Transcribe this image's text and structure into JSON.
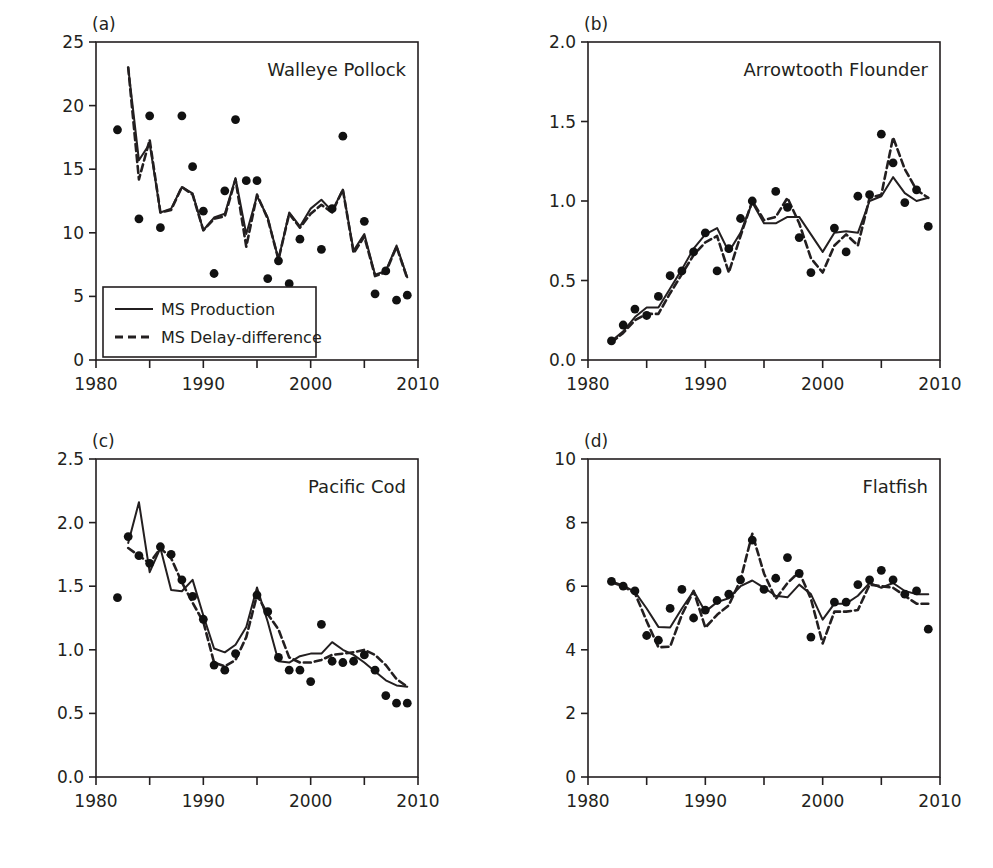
{
  "figure": {
    "xlabel": "Year",
    "ylabel": "Biomass",
    "legend": {
      "production_label": "MS Production",
      "delay_label": "MS Delay-difference",
      "position": "panel-a-lower-left"
    },
    "colors": {
      "ink": "#231f20",
      "background": "#ffffff",
      "point": "#111111"
    }
  },
  "chart_data": [
    {
      "type": "line",
      "panel": "(a)",
      "title": "Walleye Pollock",
      "xlabel": "Year",
      "ylabel": "Biomass",
      "xlim": [
        1980,
        2010
      ],
      "ylim": [
        0,
        25
      ],
      "xticks": [
        1980,
        1990,
        2000,
        2010
      ],
      "xticks_minor": [
        1985,
        1995,
        2005
      ],
      "yticks": [
        0,
        5,
        10,
        15,
        20,
        25
      ],
      "grid": false,
      "legend": [
        "MS Production",
        "MS Delay-difference"
      ],
      "x": [
        1982,
        1983,
        1984,
        1985,
        1986,
        1987,
        1988,
        1989,
        1990,
        1991,
        1992,
        1993,
        1994,
        1995,
        1996,
        1997,
        1998,
        1999,
        2000,
        2001,
        2002,
        2003,
        2004,
        2005,
        2006,
        2007,
        2008,
        2009
      ],
      "series": [
        {
          "name": "MS Production",
          "style": "solid",
          "x": [
            1983,
            1984,
            1985,
            1986,
            1987,
            1988,
            1989,
            1990,
            1991,
            1992,
            1993,
            1994,
            1995,
            1996,
            1997,
            1998,
            1999,
            2000,
            2001,
            2002,
            2003,
            2004,
            2005,
            2006,
            2007,
            2008,
            2009
          ],
          "values": [
            23.0,
            15.7,
            17.0,
            11.6,
            11.9,
            13.6,
            13.1,
            10.2,
            11.2,
            11.5,
            14.3,
            9.9,
            12.9,
            11.2,
            7.9,
            11.6,
            10.5,
            11.9,
            12.6,
            11.7,
            13.4,
            8.6,
            9.9,
            6.7,
            7.0,
            9.0,
            6.5
          ]
        },
        {
          "name": "MS Delay-difference",
          "style": "dashed",
          "x": [
            1983,
            1984,
            1985,
            1986,
            1987,
            1988,
            1989,
            1990,
            1991,
            1992,
            1993,
            1994,
            1995,
            1996,
            1997,
            1998,
            1999,
            2000,
            2001,
            2002,
            2003,
            2004,
            2005,
            2006,
            2007,
            2008,
            2009
          ],
          "values": [
            23.0,
            14.2,
            17.3,
            11.6,
            11.8,
            13.6,
            13.0,
            10.2,
            11.1,
            11.3,
            14.2,
            8.9,
            13.0,
            11.1,
            7.9,
            11.5,
            10.4,
            11.5,
            12.2,
            11.6,
            13.4,
            8.4,
            9.7,
            6.6,
            6.9,
            8.9,
            6.4
          ]
        }
      ],
      "points": {
        "name": "observed",
        "x": [
          1982,
          1984,
          1985,
          1986,
          1988,
          1989,
          1990,
          1991,
          1992,
          1993,
          1994,
          1995,
          1996,
          1997,
          1998,
          1999,
          2001,
          2002,
          2003,
          2005,
          2006,
          2007,
          2008,
          2009
        ],
        "values": [
          18.1,
          11.1,
          19.2,
          10.4,
          19.2,
          15.2,
          11.7,
          6.8,
          13.3,
          18.9,
          14.1,
          14.1,
          6.4,
          7.8,
          6.0,
          9.5,
          8.7,
          11.9,
          17.6,
          10.9,
          5.2,
          7.0,
          4.7,
          5.1
        ]
      }
    },
    {
      "type": "line",
      "panel": "(b)",
      "title": "Arrowtooth Flounder",
      "xlabel": "Year",
      "ylabel": "Biomass",
      "xlim": [
        1980,
        2010
      ],
      "ylim": [
        0.0,
        2.0
      ],
      "xticks": [
        1980,
        1990,
        2000,
        2010
      ],
      "xticks_minor": [
        1985,
        1995,
        2005
      ],
      "yticks": [
        0.0,
        0.5,
        1.0,
        1.5,
        2.0
      ],
      "grid": false,
      "legend": [
        "MS Production",
        "MS Delay-difference"
      ],
      "x": [
        1982,
        1983,
        1984,
        1985,
        1986,
        1987,
        1988,
        1989,
        1990,
        1991,
        1992,
        1993,
        1994,
        1995,
        1996,
        1997,
        1998,
        1999,
        2000,
        2001,
        2002,
        2003,
        2004,
        2005,
        2006,
        2007,
        2008,
        2009
      ],
      "series": [
        {
          "name": "MS Production",
          "style": "solid",
          "x": [
            1982,
            1983,
            1984,
            1985,
            1986,
            1987,
            1988,
            1989,
            1990,
            1991,
            1992,
            1993,
            1994,
            1995,
            1996,
            1997,
            1998,
            1999,
            2000,
            2001,
            2002,
            2003,
            2004,
            2005,
            2006,
            2007,
            2008,
            2009
          ],
          "values": [
            0.12,
            0.18,
            0.27,
            0.33,
            0.33,
            0.45,
            0.57,
            0.7,
            0.79,
            0.83,
            0.68,
            0.8,
            0.99,
            0.86,
            0.86,
            0.9,
            0.9,
            0.79,
            0.68,
            0.8,
            0.81,
            0.8,
            1.0,
            1.03,
            1.15,
            1.05,
            1.0,
            1.02
          ]
        },
        {
          "name": "MS Delay-difference",
          "style": "dashed",
          "x": [
            1982,
            1983,
            1984,
            1985,
            1986,
            1987,
            1988,
            1989,
            1990,
            1991,
            1992,
            1993,
            1994,
            1995,
            1996,
            1997,
            1998,
            1999,
            2000,
            2001,
            2002,
            2003,
            2004,
            2005,
            2006,
            2007,
            2008,
            2009
          ],
          "values": [
            0.11,
            0.17,
            0.25,
            0.29,
            0.29,
            0.42,
            0.54,
            0.66,
            0.74,
            0.78,
            0.55,
            0.78,
            1.0,
            0.88,
            0.9,
            1.02,
            0.86,
            0.64,
            0.55,
            0.72,
            0.79,
            0.72,
            1.02,
            1.04,
            1.4,
            1.2,
            1.07,
            1.02
          ]
        }
      ],
      "points": {
        "name": "observed",
        "x": [
          1982,
          1983,
          1984,
          1985,
          1986,
          1987,
          1988,
          1989,
          1990,
          1991,
          1992,
          1993,
          1994,
          1996,
          1997,
          1998,
          1999,
          2001,
          2002,
          2003,
          2004,
          2005,
          2006,
          2007,
          2008,
          2009
        ],
        "values": [
          0.12,
          0.22,
          0.32,
          0.28,
          0.4,
          0.53,
          0.56,
          0.68,
          0.8,
          0.56,
          0.7,
          0.89,
          1.0,
          1.06,
          0.96,
          0.77,
          0.55,
          0.83,
          0.68,
          1.03,
          1.04,
          1.42,
          1.24,
          0.99,
          1.07,
          0.84
        ]
      }
    },
    {
      "type": "line",
      "panel": "(c)",
      "title": "Pacific Cod",
      "xlabel": "Year",
      "ylabel": "Biomass",
      "xlim": [
        1980,
        2010
      ],
      "ylim": [
        0.0,
        2.5
      ],
      "xticks": [
        1980,
        1990,
        2000,
        2010
      ],
      "xticks_minor": [
        1985,
        1995,
        2005
      ],
      "yticks": [
        0.0,
        0.5,
        1.0,
        1.5,
        2.0,
        2.5
      ],
      "grid": false,
      "legend": [
        "MS Production",
        "MS Delay-difference"
      ],
      "x": [
        1982,
        1983,
        1984,
        1985,
        1986,
        1987,
        1988,
        1989,
        1990,
        1991,
        1992,
        1993,
        1994,
        1995,
        1996,
        1997,
        1998,
        1999,
        2000,
        2001,
        2002,
        2003,
        2004,
        2005,
        2006,
        2007,
        2008,
        2009
      ],
      "series": [
        {
          "name": "MS Production",
          "style": "solid",
          "x": [
            1983,
            1984,
            1985,
            1986,
            1987,
            1988,
            1989,
            1990,
            1991,
            1992,
            1993,
            1994,
            1995,
            1996,
            1997,
            1998,
            1999,
            2000,
            2001,
            2002,
            2003,
            2004,
            2005,
            2006,
            2007,
            2008,
            2009
          ],
          "values": [
            1.84,
            2.16,
            1.61,
            1.8,
            1.47,
            1.46,
            1.55,
            1.27,
            1.01,
            0.98,
            1.04,
            1.18,
            1.49,
            1.22,
            0.91,
            0.9,
            0.95,
            0.97,
            0.97,
            1.06,
            1.0,
            0.96,
            0.9,
            0.83,
            0.76,
            0.72,
            0.71
          ]
        },
        {
          "name": "MS Delay-difference",
          "style": "dashed",
          "x": [
            1983,
            1984,
            1985,
            1986,
            1987,
            1988,
            1989,
            1990,
            1991,
            1992,
            1993,
            1994,
            1995,
            1996,
            1997,
            1998,
            1999,
            2000,
            2001,
            2002,
            2003,
            2004,
            2005,
            2006,
            2007,
            2008,
            2009
          ],
          "values": [
            1.8,
            1.74,
            1.68,
            1.8,
            1.72,
            1.53,
            1.37,
            1.22,
            0.9,
            0.87,
            0.92,
            1.1,
            1.43,
            1.28,
            1.16,
            0.94,
            0.9,
            0.9,
            0.92,
            0.96,
            0.97,
            0.98,
            1.0,
            0.96,
            0.88,
            0.77,
            0.71
          ]
        }
      ],
      "points": {
        "name": "observed",
        "x": [
          1982,
          1983,
          1984,
          1985,
          1986,
          1987,
          1988,
          1989,
          1990,
          1991,
          1992,
          1993,
          1995,
          1996,
          1997,
          1998,
          1999,
          2000,
          2001,
          2002,
          2003,
          2004,
          2005,
          2006,
          2007,
          2008,
          2009
        ],
        "values": [
          1.41,
          1.89,
          1.74,
          1.68,
          1.81,
          1.75,
          1.55,
          1.42,
          1.24,
          0.88,
          0.84,
          0.97,
          1.43,
          1.3,
          0.94,
          0.84,
          0.84,
          0.75,
          1.2,
          0.91,
          0.9,
          0.91,
          0.96,
          0.84,
          0.64,
          0.58,
          0.58
        ]
      }
    },
    {
      "type": "line",
      "panel": "(d)",
      "title": "Flatfish",
      "xlabel": "Year",
      "ylabel": "Biomass",
      "xlim": [
        1980,
        2010
      ],
      "ylim": [
        0,
        10
      ],
      "xticks": [
        1980,
        1990,
        2000,
        2010
      ],
      "xticks_minor": [
        1985,
        1995,
        2005
      ],
      "yticks": [
        0,
        2,
        4,
        6,
        8,
        10
      ],
      "grid": false,
      "legend": [
        "MS Production",
        "MS Delay-difference"
      ],
      "x": [
        1982,
        1983,
        1984,
        1985,
        1986,
        1987,
        1988,
        1989,
        1990,
        1991,
        1992,
        1993,
        1994,
        1995,
        1996,
        1997,
        1998,
        1999,
        2000,
        2001,
        2002,
        2003,
        2004,
        2005,
        2006,
        2007,
        2008,
        2009
      ],
      "series": [
        {
          "name": "MS Production",
          "style": "solid",
          "x": [
            1982,
            1983,
            1984,
            1985,
            1986,
            1987,
            1988,
            1989,
            1990,
            1991,
            1992,
            1993,
            1994,
            1995,
            1996,
            1997,
            1998,
            1999,
            2000,
            2001,
            2002,
            2003,
            2004,
            2005,
            2006,
            2007,
            2008,
            2009
          ],
          "values": [
            6.15,
            6.02,
            5.82,
            5.3,
            4.72,
            4.7,
            5.3,
            5.85,
            5.2,
            5.5,
            5.62,
            6.0,
            6.18,
            5.95,
            5.7,
            5.65,
            6.05,
            5.75,
            4.95,
            5.45,
            5.45,
            5.7,
            6.1,
            5.95,
            6.1,
            5.85,
            5.75,
            5.75
          ]
        },
        {
          "name": "MS Delay-difference",
          "style": "dashed",
          "x": [
            1982,
            1983,
            1984,
            1985,
            1986,
            1987,
            1988,
            1989,
            1990,
            1991,
            1992,
            1993,
            1994,
            1995,
            1996,
            1997,
            1998,
            1999,
            2000,
            2001,
            2002,
            2003,
            2004,
            2005,
            2006,
            2007,
            2008,
            2009
          ],
          "values": [
            6.12,
            6.0,
            5.78,
            4.9,
            4.08,
            4.1,
            5.1,
            5.85,
            4.7,
            5.1,
            5.4,
            6.2,
            7.65,
            6.4,
            5.6,
            6.1,
            6.45,
            5.6,
            4.2,
            5.2,
            5.2,
            5.25,
            6.05,
            6.0,
            5.95,
            5.7,
            5.45,
            5.45
          ]
        }
      ],
      "points": {
        "name": "observed",
        "x": [
          1982,
          1983,
          1984,
          1985,
          1986,
          1987,
          1988,
          1989,
          1990,
          1991,
          1992,
          1993,
          1994,
          1995,
          1996,
          1997,
          1998,
          1999,
          2001,
          2002,
          2003,
          2004,
          2005,
          2006,
          2007,
          2008,
          2009
        ],
        "values": [
          6.15,
          6.0,
          5.85,
          4.45,
          4.3,
          5.3,
          5.9,
          5.0,
          5.25,
          5.55,
          5.75,
          6.2,
          7.45,
          5.9,
          6.25,
          6.9,
          6.4,
          4.4,
          5.5,
          5.5,
          6.05,
          6.2,
          6.5,
          6.2,
          5.75,
          5.85,
          4.65
        ]
      }
    }
  ]
}
